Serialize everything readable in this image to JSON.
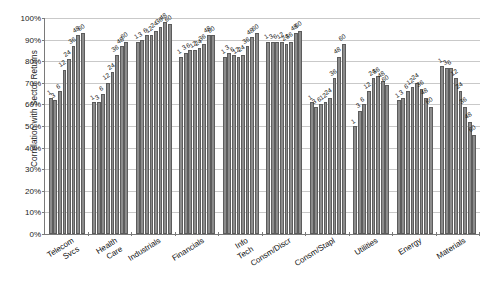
{
  "chart_data": {
    "type": "bar",
    "title": "",
    "xlabel": "",
    "ylabel": "Correlation with Sector Returns",
    "ylim": [
      0,
      100
    ],
    "ytick_labels": [
      "0%",
      "10%",
      "20%",
      "30%",
      "40%",
      "50%",
      "60%",
      "70%",
      "80%",
      "90%",
      "100%"
    ],
    "ytick_values": [
      0,
      10,
      20,
      30,
      40,
      50,
      60,
      70,
      80,
      90,
      100
    ],
    "grid": true,
    "legend": "none",
    "bar_series_labels": [
      "1",
      "3",
      "6",
      "12",
      "24",
      "36",
      "48",
      "60"
    ],
    "categories": [
      "Telecom Svcs",
      "Health Care",
      "Industrials",
      "Financials",
      "Info Tech",
      "Consm/Discr",
      "Consm/Stapl",
      "Utilities",
      "Energy",
      "Materials"
    ],
    "groups": [
      {
        "category": "Telecom Svcs",
        "bars": [
          {
            "label": "1",
            "value": 63
          },
          {
            "label": "3",
            "value": 62
          },
          {
            "label": "6",
            "value": 66
          },
          {
            "label": "12",
            "value": 76
          },
          {
            "label": "24",
            "value": 81
          },
          {
            "label": "36",
            "value": 87
          },
          {
            "label": "48",
            "value": 92
          },
          {
            "label": "60",
            "value": 93
          }
        ]
      },
      {
        "category": "Health Care",
        "bars": [
          {
            "label": "1",
            "value": 61
          },
          {
            "label": "3",
            "value": 61
          },
          {
            "label": "6",
            "value": 65
          },
          {
            "label": "12",
            "value": 70
          },
          {
            "label": "24",
            "value": 75
          },
          {
            "label": "36",
            "value": 83
          },
          {
            "label": "48",
            "value": 87
          },
          {
            "label": "60",
            "value": 89
          }
        ]
      },
      {
        "category": "Industrials",
        "bars": [
          {
            "label": "1",
            "value": 89
          },
          {
            "label": "3",
            "value": 90
          },
          {
            "label": "6",
            "value": 92
          },
          {
            "label": "12",
            "value": 92
          },
          {
            "label": "24",
            "value": 94
          },
          {
            "label": "36",
            "value": 96
          },
          {
            "label": "48",
            "value": 98
          },
          {
            "label": "60",
            "value": 97
          }
        ]
      },
      {
        "category": "Financials",
        "bars": [
          {
            "label": "1",
            "value": 82
          },
          {
            "label": "3",
            "value": 84
          },
          {
            "label": "6",
            "value": 85
          },
          {
            "label": "12",
            "value": 85
          },
          {
            "label": "24",
            "value": 86
          },
          {
            "label": "36",
            "value": 88
          },
          {
            "label": "48",
            "value": 92
          },
          {
            "label": "60",
            "value": 92
          }
        ]
      },
      {
        "category": "Info Tech",
        "bars": [
          {
            "label": "1",
            "value": 82
          },
          {
            "label": "3",
            "value": 84
          },
          {
            "label": "6",
            "value": 83
          },
          {
            "label": "12",
            "value": 82
          },
          {
            "label": "24",
            "value": 83
          },
          {
            "label": "36",
            "value": 87
          },
          {
            "label": "48",
            "value": 91
          },
          {
            "label": "60",
            "value": 93
          }
        ]
      },
      {
        "category": "Consm/Discr",
        "bars": [
          {
            "label": "1",
            "value": 89
          },
          {
            "label": "3",
            "value": 89
          },
          {
            "label": "6",
            "value": 89
          },
          {
            "label": "12",
            "value": 89
          },
          {
            "label": "24",
            "value": 88
          },
          {
            "label": "36",
            "value": 89
          },
          {
            "label": "48",
            "value": 93
          },
          {
            "label": "60",
            "value": 94
          }
        ]
      },
      {
        "category": "Consm/Stapl",
        "bars": [
          {
            "label": "1",
            "value": 61
          },
          {
            "label": "3",
            "value": 59
          },
          {
            "label": "6",
            "value": 60
          },
          {
            "label": "12",
            "value": 61
          },
          {
            "label": "24",
            "value": 63
          },
          {
            "label": "36",
            "value": 72
          },
          {
            "label": "48",
            "value": 82
          },
          {
            "label": "60",
            "value": 88
          }
        ]
      },
      {
        "category": "Utilities",
        "bars": [
          {
            "label": "1",
            "value": 50
          },
          {
            "label": "3",
            "value": 57
          },
          {
            "label": "6",
            "value": 60
          },
          {
            "label": "12",
            "value": 66
          },
          {
            "label": "24",
            "value": 72
          },
          {
            "label": "36",
            "value": 73
          },
          {
            "label": "48",
            "value": 71
          },
          {
            "label": "60",
            "value": 69
          }
        ]
      },
      {
        "category": "Energy",
        "bars": [
          {
            "label": "1",
            "value": 62
          },
          {
            "label": "3",
            "value": 63
          },
          {
            "label": "6",
            "value": 66
          },
          {
            "label": "12",
            "value": 68
          },
          {
            "label": "24",
            "value": 70
          },
          {
            "label": "36",
            "value": 67
          },
          {
            "label": "48",
            "value": 63
          },
          {
            "label": "60",
            "value": 59
          }
        ]
      },
      {
        "category": "Materials",
        "bars": [
          {
            "label": "1",
            "value": 78
          },
          {
            "label": "3",
            "value": 77
          },
          {
            "label": "6",
            "value": 77
          },
          {
            "label": "12",
            "value": 72
          },
          {
            "label": "24",
            "value": 66
          },
          {
            "label": "36",
            "value": 59
          },
          {
            "label": "48",
            "value": 52
          },
          {
            "label": "60",
            "value": 46
          }
        ]
      }
    ]
  },
  "colors": {
    "bar_fill": "#8c8c8c",
    "bar_stroke": "#5c5c5c",
    "gridline": "#c9c9c9",
    "axis": "#7a7a7a",
    "text": "#111111",
    "background": "#ffffff"
  }
}
